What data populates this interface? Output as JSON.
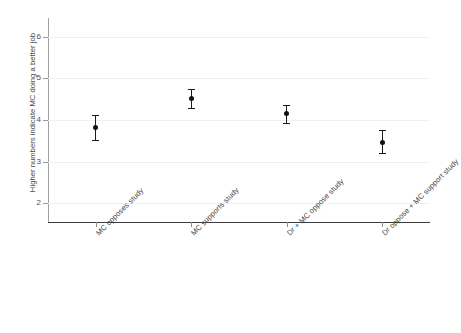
{
  "chart_data": {
    "type": "scatter",
    "title": "",
    "xlabel": "",
    "ylabel": "Higher numbers indicate MC doing a better job",
    "ylim": [
      1.55,
      6.45
    ],
    "yticks": [
      2,
      3,
      4,
      5,
      6
    ],
    "ytick_labels": [
      "2",
      "3",
      "4",
      "5",
      "6"
    ],
    "grid": true,
    "legend": false,
    "categories": [
      "MC opposes study",
      "MC supports study",
      "Dr + MC oppose study",
      "Dr oppose + MC support study"
    ],
    "values": [
      3.83,
      4.52,
      4.15,
      3.47
    ],
    "error_low": [
      3.53,
      4.28,
      3.93,
      3.21
    ],
    "error_high": [
      4.13,
      4.75,
      4.37,
      3.76
    ],
    "series": [
      {
        "name": "Mean with 95% CI",
        "values": [
          3.83,
          4.52,
          4.15,
          3.47
        ]
      }
    ],
    "colors": {
      "marker": "#111111",
      "errorbar": "#1a1a1a",
      "gridline": "#f0f0f0",
      "axis": "#3d3d3d",
      "text": "#4a4a4a",
      "background": "#ffffff"
    }
  }
}
